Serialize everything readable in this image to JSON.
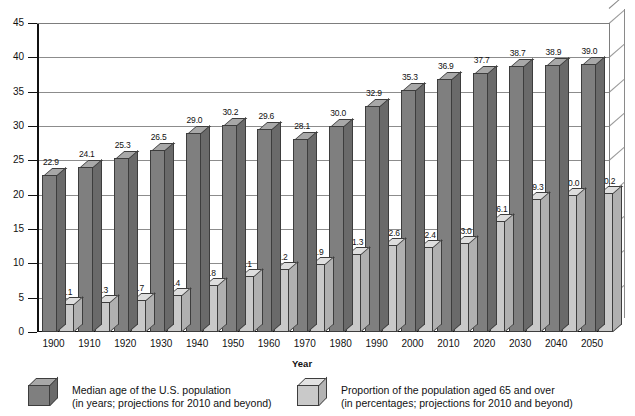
{
  "chart_data": {
    "type": "bar",
    "title": "",
    "xlabel": "Year",
    "ylabel": "",
    "ylim": [
      0,
      45
    ],
    "ytick_step": 5,
    "yticks": [
      "0",
      "5",
      "10",
      "15",
      "20",
      "25",
      "30",
      "35",
      "40",
      "45"
    ],
    "grid": true,
    "legend_position": "bottom",
    "categories": [
      "1900",
      "1910",
      "1920",
      "1930",
      "1940",
      "1950",
      "1960",
      "1970",
      "1980",
      "1990",
      "2000",
      "2010",
      "2020",
      "2030",
      "2040",
      "2050"
    ],
    "series": [
      {
        "name": "Median age of the U.S. population",
        "key": "median_age",
        "color": "#7f7f7f",
        "values": [
          22.9,
          24.1,
          25.3,
          26.5,
          29.0,
          30.2,
          29.6,
          28.1,
          30.0,
          32.9,
          35.3,
          36.9,
          37.7,
          38.7,
          38.9,
          39.0
        ],
        "labels": [
          "22.9",
          "24.1",
          "25.3",
          "26.5",
          "29.0",
          "30.2",
          "29.6",
          "28.1",
          "30.0",
          "32.9",
          "35.3",
          "36.9",
          "37.7",
          "38.7",
          "38.9",
          "39.0"
        ]
      },
      {
        "name": "Proportion of the population aged 65 and over",
        "key": "pct_65_over",
        "color": "#c9c9c9",
        "values": [
          4.1,
          4.3,
          4.7,
          5.4,
          6.8,
          8.1,
          9.2,
          9.9,
          11.3,
          12.6,
          12.4,
          13.0,
          16.1,
          19.3,
          20.0,
          20.2
        ],
        "labels": [
          "4.1",
          "4.3",
          "4.7",
          "5.4",
          "6.8",
          "8.1",
          "9.2",
          "9.9",
          "11.3",
          "12.6",
          "12.4",
          "13.0",
          "16.1",
          "19.3",
          "20.0",
          "20.2"
        ]
      }
    ]
  },
  "legend": {
    "items": [
      {
        "swatch": "dark",
        "line1": "Median age of the U.S. population",
        "line2": "(in years; projections for 2010 and beyond)"
      },
      {
        "swatch": "light",
        "line1": "Proportion of the population aged 65 and over",
        "line2": "(in percentages; projections for 2010 and beyond)"
      }
    ]
  }
}
